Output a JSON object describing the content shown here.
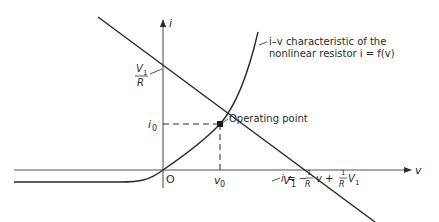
{
  "figure": {
    "axes": {
      "y_label": "i",
      "x_label": "v",
      "origin_label": "O"
    },
    "ticks": {
      "y_intercept": {
        "num": "V",
        "num_sub": "1",
        "den": "R"
      },
      "i0": {
        "base": "i",
        "sub": "0"
      },
      "v0": {
        "base": "v",
        "sub": "0"
      },
      "v1": {
        "base": "V",
        "sub": "1"
      }
    },
    "annotations": {
      "curve_line1": "i–v characteristic of the",
      "curve_line2": "nonlinear resistor i = f(v)",
      "operating_point": "Operating point",
      "load_line_eq_prefix": "i = −",
      "load_line_eq_frac1_num": "1",
      "load_line_eq_frac1_den": "R",
      "load_line_eq_mid": "v +",
      "load_line_eq_frac2_num": "1",
      "load_line_eq_frac2_den": "R",
      "load_line_eq_tail": "V",
      "load_line_eq_tail_sub": "1"
    },
    "colors": {
      "ink": "#2a2a2a",
      "axis": "#555555"
    }
  }
}
